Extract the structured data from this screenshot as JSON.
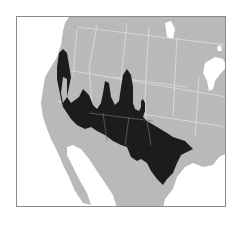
{
  "map": {
    "type": "range-map",
    "region": "Western & Southern North America",
    "colors": {
      "background": "#ffffff",
      "land": "#b9b9b9",
      "range": "#1c1c1c",
      "borders": "#e2e2e2",
      "water": "#ffffff",
      "frame": "#8a8a8a"
    },
    "legend": []
  }
}
